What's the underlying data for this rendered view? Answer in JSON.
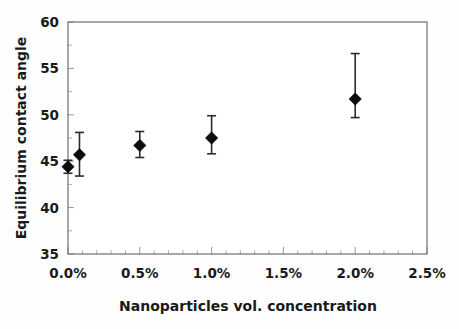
{
  "chart_data": {
    "type": "scatter",
    "title": "",
    "xlabel": "Nanoparticles vol. concentration",
    "ylabel": "Equilibrium contact angle",
    "xlim": [
      0.0,
      2.5
    ],
    "ylim": [
      35,
      60
    ],
    "grid": false,
    "legend": null,
    "x_tick_labels": [
      "0.0%",
      "0.5%",
      "1.0%",
      "1.5%",
      "2.0%",
      "2.5%"
    ],
    "x_tick_values": [
      0.0,
      0.5,
      1.0,
      1.5,
      2.0,
      2.5
    ],
    "y_tick_labels": [
      "35",
      "40",
      "45",
      "50",
      "55",
      "60"
    ],
    "y_tick_values": [
      35,
      40,
      45,
      50,
      55,
      60
    ],
    "x_minor_tick_count": 4,
    "y_minor_tick_count": 1,
    "marker_style": "filled-diamond",
    "error_bar_style": "vertical-capped",
    "series": [
      {
        "name": "Equilibrium contact angle",
        "points": [
          {
            "x": 0.0,
            "y": 44.4,
            "yerr_low": 43.7,
            "yerr_high": 45.1,
            "x_label": "0.0%"
          },
          {
            "x": 0.08,
            "y": 45.7,
            "yerr_low": 43.4,
            "yerr_high": 48.1,
            "x_label": "0.1%"
          },
          {
            "x": 0.5,
            "y": 46.7,
            "yerr_low": 45.4,
            "yerr_high": 48.2,
            "x_label": "0.5%"
          },
          {
            "x": 1.0,
            "y": 47.5,
            "yerr_low": 45.8,
            "yerr_high": 49.9,
            "x_label": "1.0%"
          },
          {
            "x": 2.0,
            "y": 51.7,
            "yerr_low": 49.7,
            "yerr_high": 56.6,
            "x_label": "2.0%"
          }
        ]
      }
    ]
  },
  "style": {
    "marker_color": "#0d0d0d",
    "error_color": "#2b2b2b",
    "frame_color": "#6f6f6f",
    "tick_color": "#9a9a9a",
    "text_color": "#1a1a1a",
    "background": "#ffffff"
  }
}
